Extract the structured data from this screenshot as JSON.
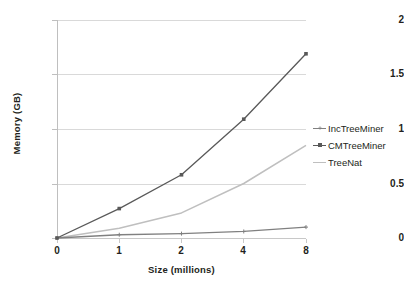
{
  "chart_data": {
    "type": "line",
    "title": "",
    "xlabel": "Size (millions)",
    "ylabel": "Memory (GB)",
    "categories": [
      "0",
      "1",
      "2",
      "4",
      "8"
    ],
    "x": [
      0,
      1,
      2,
      4,
      8
    ],
    "xlim": [
      0,
      4
    ],
    "ylim": [
      0,
      2
    ],
    "yticks": [
      "0",
      "0.5",
      "1",
      "1.5",
      "2"
    ],
    "ytick_values": [
      0,
      0.5,
      1,
      1.5,
      2
    ],
    "grid": "horizontal",
    "legend_position": "right",
    "series": [
      {
        "name": "IncTreeMiner",
        "values": [
          0,
          0.03,
          0.04,
          0.06,
          0.1
        ],
        "color": "#808080",
        "marker": "plus"
      },
      {
        "name": "CMTreeMiner",
        "values": [
          0,
          0.27,
          0.58,
          1.09,
          1.69
        ],
        "color": "#595959",
        "marker": "square"
      },
      {
        "name": "TreeNat",
        "values": [
          0,
          0.09,
          0.23,
          0.5,
          0.85
        ],
        "color": "#bfbfbf",
        "marker": "none"
      }
    ]
  },
  "axis": {
    "x_title": "Size (millions)",
    "y_title": "Memory (GB)",
    "x_ticks": [
      "0",
      "1",
      "2",
      "4",
      "8"
    ],
    "y_ticks": [
      "0",
      "0.5",
      "1",
      "1.5",
      "2"
    ]
  },
  "legend": {
    "items": [
      {
        "label": "IncTreeMiner",
        "color": "#808080"
      },
      {
        "label": "CMTreeMiner",
        "color": "#595959"
      },
      {
        "label": "TreeNat",
        "color": "#bfbfbf"
      }
    ]
  },
  "colors": {
    "background": "#ffffff",
    "gridline": "#d9d9d9",
    "axis": "#bfbfbf",
    "text": "#231f20"
  }
}
